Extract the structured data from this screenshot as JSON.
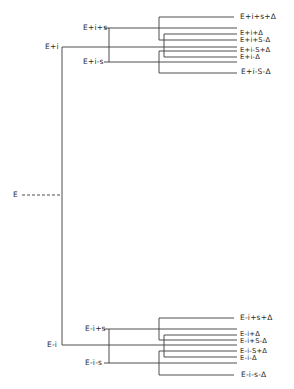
{
  "diagram": {
    "type": "energy-level splitting tree",
    "line_color": "#3a3a3a",
    "root": {
      "label": "E"
    },
    "level1": [
      {
        "label": "E+i"
      },
      {
        "label": "E-i"
      }
    ],
    "level2": {
      "top": [
        {
          "label": "E+i+s"
        },
        {
          "label": "E+i-s"
        }
      ],
      "bottom": [
        {
          "label": "E-i+s"
        },
        {
          "label": "E-i-s"
        }
      ]
    },
    "level3": {
      "top": [
        {
          "label": "E+i+s+Δ"
        },
        {
          "label": "E+i+Δ"
        },
        {
          "label": "E+i+S-Δ"
        },
        {
          "label": "E+i-S+Δ"
        },
        {
          "label": "E+i-Δ"
        },
        {
          "label": "E+i-S-Δ"
        }
      ],
      "bottom": [
        {
          "label": "E-i+s+Δ"
        },
        {
          "label": "E-i+Δ"
        },
        {
          "label": "E-i+S-Δ"
        },
        {
          "label": "E-i-S+Δ"
        },
        {
          "label": "E-i-Δ"
        },
        {
          "label": "E-i-s-Δ"
        }
      ]
    }
  }
}
